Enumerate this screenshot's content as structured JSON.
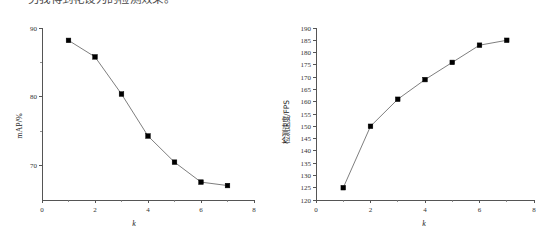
{
  "caption": {
    "text": "另我得到花设为的检测效果。"
  },
  "charts": {
    "left": {
      "ylabel": "mAP/%",
      "xlabel": "k"
    },
    "right": {
      "ylabel": "检测速度/FPS",
      "xlabel": "k"
    }
  },
  "colors": {
    "line": "#6f6f6f",
    "marker": "#000000",
    "axis": "#555555",
    "background": "#ffffff"
  },
  "chart_data": [
    {
      "type": "line",
      "title": "",
      "xlabel": "k",
      "ylabel": "mAP/%",
      "x": [
        1,
        2,
        3,
        4,
        5,
        6,
        7
      ],
      "values": [
        88.2,
        85.8,
        80.4,
        74.3,
        70.5,
        67.6,
        67.1
      ],
      "xlim": [
        0,
        8
      ],
      "ylim": [
        65,
        90
      ],
      "xticks": [
        0,
        2,
        4,
        6,
        8
      ],
      "xtick_labels": [
        "0",
        "2",
        "4",
        "6",
        "8"
      ],
      "yticks": [
        70,
        80,
        90
      ],
      "ytick_labels": [
        "70",
        "80",
        "90"
      ],
      "yminor": [
        75,
        85
      ],
      "grid": false,
      "legend": null,
      "marker": "square"
    },
    {
      "type": "line",
      "title": "",
      "xlabel": "k",
      "ylabel": "检测速度/FPS",
      "x": [
        1,
        2,
        3,
        4,
        5,
        6,
        7
      ],
      "values": [
        125,
        150,
        161,
        169,
        176,
        183,
        185
      ],
      "xlim": [
        0,
        8
      ],
      "ylim": [
        120,
        190
      ],
      "xticks": [
        0,
        2,
        4,
        6,
        8
      ],
      "xtick_labels": [
        "0",
        "2",
        "4",
        "6",
        "8"
      ],
      "yticks": [
        120,
        125,
        130,
        135,
        140,
        145,
        150,
        155,
        160,
        165,
        170,
        175,
        180,
        185,
        190
      ],
      "ytick_labels": [
        "120",
        "125",
        "130",
        "135",
        "140",
        "145",
        "150",
        "155",
        "160",
        "165",
        "170",
        "175",
        "180",
        "185",
        "190"
      ],
      "grid": false,
      "legend": null,
      "marker": "square"
    }
  ]
}
